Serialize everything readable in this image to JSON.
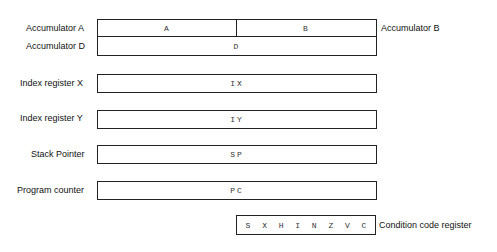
{
  "registers": {
    "acc_a": {
      "label": "Accumulator A",
      "field": "A"
    },
    "acc_b": {
      "label": "Accumulator B",
      "field": "B"
    },
    "acc_d": {
      "label": "Accumulator D",
      "field": "D"
    },
    "ix": {
      "label": "Index register X",
      "field": "IX"
    },
    "iy": {
      "label": "Index register Y",
      "field": "IY"
    },
    "sp": {
      "label": "Stack Pointer",
      "field": "SP"
    },
    "pc": {
      "label": "Program counter",
      "field": "PC"
    },
    "ccr": {
      "label": "Condition code register",
      "bits": [
        "S",
        "X",
        "H",
        "I",
        "N",
        "Z",
        "V",
        "C"
      ]
    }
  }
}
